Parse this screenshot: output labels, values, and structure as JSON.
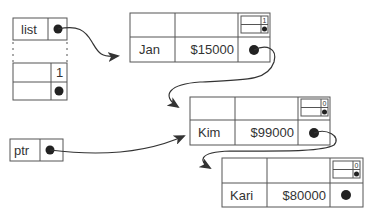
{
  "diagram": {
    "type": "linked-list-with-reference-counts",
    "head": {
      "label": "list",
      "pointer": "dot"
    },
    "header_node": {
      "count": "1"
    },
    "ptr": {
      "label": "ptr",
      "pointer": "dot"
    },
    "nodes": [
      {
        "name": "Jan",
        "salary": "$15000",
        "ref_count": "1"
      },
      {
        "name": "Kim",
        "salary": "$99000",
        "ref_count": "0"
      },
      {
        "name": "Kari",
        "salary": "$80000",
        "ref_count": "0"
      }
    ],
    "colors": {
      "line": "#444444",
      "dot": "#222222",
      "text": "#333333"
    }
  }
}
